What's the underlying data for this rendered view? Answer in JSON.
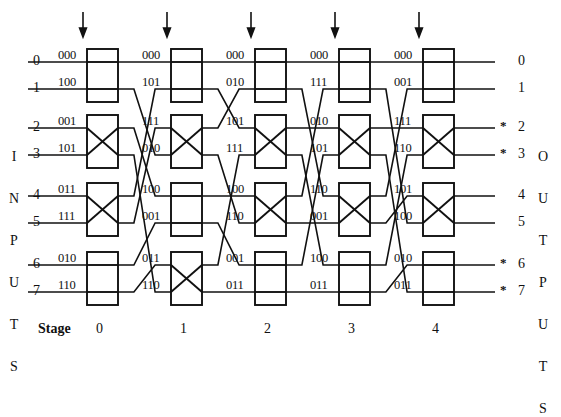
{
  "figure": {
    "kind": "multistage-interconnection-network",
    "left_label": "INPUTS",
    "right_label": "OUTPUTS",
    "stage_label": "Stage",
    "stage_numbers": [
      "0",
      "1",
      "2",
      "3",
      "4"
    ],
    "row_numbers": [
      "0",
      "1",
      "2",
      "3",
      "4",
      "5",
      "6",
      "7"
    ],
    "input_numbers": [
      "0",
      "1",
      "2",
      "3",
      "4",
      "5",
      "6",
      "7"
    ],
    "output_numbers": [
      "0",
      "1",
      "2",
      "3",
      "4",
      "5",
      "6",
      "7"
    ],
    "output_star_marker": "*",
    "starred_outputs": [
      2,
      3,
      6,
      7
    ],
    "arrow_glyph": "down-arrow",
    "line_color": "#111111",
    "background_color": "#ffffff"
  },
  "chart_data": {
    "type": "diagram",
    "title": "",
    "stages": [
      {
        "index": "0",
        "tags": [
          "000",
          "100",
          "001",
          "101",
          "011",
          "111",
          "010",
          "110"
        ],
        "switch_states": [
          "straight",
          "cross",
          "cross",
          "straight"
        ]
      },
      {
        "index": "1",
        "tags": [
          "000",
          "101",
          "111",
          "010",
          "100",
          "001",
          "011",
          "110"
        ],
        "switch_states": [
          "straight",
          "cross",
          "straight",
          "cross"
        ]
      },
      {
        "index": "2",
        "tags": [
          "000",
          "010",
          "101",
          "111",
          "100",
          "110",
          "001",
          "011"
        ],
        "switch_states": [
          "straight",
          "cross",
          "cross",
          "straight"
        ]
      },
      {
        "index": "3",
        "tags": [
          "000",
          "111",
          "010",
          "101",
          "110",
          "001",
          "100",
          "011"
        ],
        "switch_states": [
          "straight",
          "cross",
          "cross",
          "straight"
        ]
      },
      {
        "index": "4",
        "tags": [
          "000",
          "001",
          "111",
          "110",
          "101",
          "100",
          "010",
          "011"
        ],
        "switch_states": [
          "straight",
          "cross",
          "cross",
          "straight"
        ]
      }
    ]
  }
}
